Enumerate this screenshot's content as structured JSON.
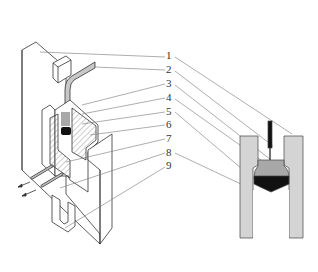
{
  "figure": {
    "type": "technical-diagram",
    "left_view": "isometric sectional view of mold assembly",
    "right_view": "cross-section of cavity with punch and material",
    "labels": [
      {
        "id": 1,
        "text": "1"
      },
      {
        "id": 2,
        "text": "2"
      },
      {
        "id": 3,
        "text": "3"
      },
      {
        "id": 4,
        "text": "4"
      },
      {
        "id": 5,
        "text": "5"
      },
      {
        "id": 6,
        "text": "6"
      },
      {
        "id": 7,
        "text": "7"
      },
      {
        "id": 8,
        "text": "8"
      },
      {
        "id": 9,
        "text": "9"
      }
    ],
    "colors": {
      "line": "#333333",
      "light_fill": "#d4d4d4",
      "mid_fill": "#a8a8a8",
      "dark_fill": "#111111",
      "leader": "#777777"
    }
  }
}
